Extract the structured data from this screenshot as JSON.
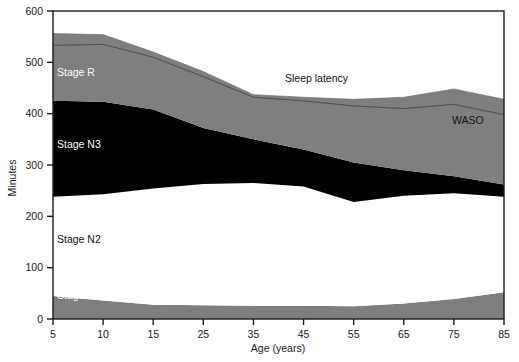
{
  "chart_data": {
    "type": "area",
    "title": "",
    "xlabel": "Age (years)",
    "ylabel": "Minutes",
    "categories": [
      "5",
      "10",
      "15",
      "25",
      "35",
      "45",
      "55",
      "65",
      "75",
      "85"
    ],
    "x": [
      5,
      10,
      15,
      25,
      35,
      45,
      55,
      65,
      75,
      85
    ],
    "ylim": [
      0,
      600
    ],
    "yticks": [
      0,
      100,
      200,
      300,
      400,
      500,
      600
    ],
    "grid": false,
    "legend": "inline-labels",
    "stacking": "cumulative-from-zero",
    "boundaries": {
      "stage_n1_top": [
        45,
        36,
        28,
        27,
        26,
        26,
        25,
        30,
        39,
        52
      ],
      "stage_n2_top": [
        238,
        243,
        254,
        263,
        265,
        258,
        228,
        240,
        245,
        238
      ],
      "stage_n3_top": [
        425,
        423,
        408,
        372,
        350,
        330,
        305,
        290,
        278,
        262
      ],
      "stage_r_top": [
        533,
        535,
        510,
        472,
        432,
        425,
        415,
        410,
        418,
        398
      ],
      "waso_top": [
        556,
        554,
        520,
        482,
        437,
        432,
        428,
        432,
        448,
        428
      ]
    },
    "series": [
      {
        "name": "Stage N1",
        "color": "#7f7f7f",
        "values": [
          45,
          36,
          28,
          27,
          26,
          26,
          25,
          30,
          39,
          52
        ]
      },
      {
        "name": "Stage N2",
        "color": "#ffffff",
        "values": [
          193,
          207,
          226,
          236,
          239,
          232,
          203,
          210,
          206,
          186
        ]
      },
      {
        "name": "Stage N3",
        "color": "#000000",
        "values": [
          187,
          180,
          154,
          109,
          85,
          72,
          77,
          50,
          33,
          24
        ]
      },
      {
        "name": "Stage R",
        "color": "#7f7f7f",
        "values": [
          108,
          112,
          102,
          100,
          82,
          95,
          110,
          120,
          140,
          136
        ]
      },
      {
        "name": "WASO",
        "color": "#7f7f7f",
        "values": [
          23,
          19,
          10,
          10,
          5,
          7,
          13,
          22,
          30,
          30
        ]
      }
    ],
    "annotations": [
      {
        "name": "stage-r-label",
        "text": "Stage R",
        "x": 57,
        "y": 76,
        "style": "light"
      },
      {
        "name": "stage-n3-label",
        "text": "Stage N3",
        "x": 57,
        "y": 148,
        "style": "light"
      },
      {
        "name": "stage-n2-label",
        "text": "Stage N2",
        "x": 57,
        "y": 243,
        "style": "dark"
      },
      {
        "name": "stage-n1-label",
        "text": "Stage N1",
        "x": 57,
        "y": 299,
        "style": "light"
      },
      {
        "name": "sleep-latency-label",
        "text": "Sleep latency",
        "x": 285,
        "y": 82,
        "style": "dark"
      },
      {
        "name": "waso-label",
        "text": "WASO",
        "x": 452,
        "y": 124,
        "style": "dark"
      }
    ],
    "labels": {
      "stage_r": "Stage R",
      "stage_n3": "Stage N3",
      "stage_n2": "Stage N2",
      "stage_n1": "Stage N1",
      "sleep_latency": "Sleep latency",
      "waso": "WASO"
    },
    "colors": {
      "gray_band": "#7f7f7f",
      "black_band": "#000000",
      "white_band": "#ffffff",
      "axis": "#1a1a1a",
      "background": "#ffffff"
    }
  }
}
